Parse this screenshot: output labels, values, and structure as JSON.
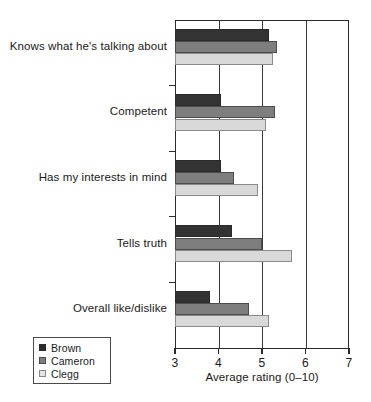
{
  "chart_data": {
    "type": "bar",
    "orientation": "horizontal",
    "title": "",
    "xlabel": "Average rating (0–10)",
    "ylabel": "",
    "xlim": [
      3,
      7
    ],
    "xticks": [
      "3",
      "4",
      "5",
      "6",
      "7"
    ],
    "grid": true,
    "grid_axis": "x",
    "legend_position": "bottom-left",
    "categories": [
      "Knows what he's talking about",
      "Competent",
      "Has my interests in mind",
      "Tells truth",
      "Overall like/dislike"
    ],
    "series": [
      {
        "name": "Brown",
        "color": "#333333",
        "values": [
          5.15,
          4.05,
          4.05,
          4.3,
          3.8
        ]
      },
      {
        "name": "Cameron",
        "color": "#7e7e7e",
        "values": [
          5.35,
          5.3,
          4.35,
          5.0,
          4.7
        ]
      },
      {
        "name": "Clegg",
        "color": "#d9d9d9",
        "values": [
          5.25,
          5.1,
          4.9,
          5.7,
          5.15
        ]
      }
    ]
  },
  "legend": {
    "items": [
      {
        "label": "Brown"
      },
      {
        "label": "Cameron"
      },
      {
        "label": "Clegg"
      }
    ]
  }
}
